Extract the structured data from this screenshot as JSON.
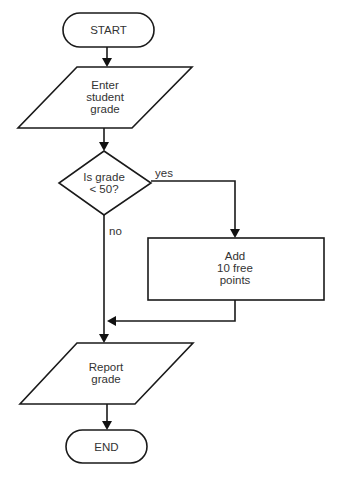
{
  "diagram": {
    "type": "flowchart",
    "nodes": {
      "start": {
        "shape": "terminator",
        "label": "START"
      },
      "input": {
        "shape": "parallelogram",
        "label": "Enter\nstudent\ngrade"
      },
      "decision": {
        "shape": "diamond",
        "label": "Is grade\n< 50?"
      },
      "process": {
        "shape": "rectangle",
        "label": "Add\n10 free\npoints"
      },
      "output": {
        "shape": "parallelogram",
        "label": "Report\ngrade"
      },
      "end": {
        "shape": "terminator",
        "label": "END"
      }
    },
    "edges": {
      "yes_label": "yes",
      "no_label": "no"
    },
    "connections": [
      [
        "start",
        "input"
      ],
      [
        "input",
        "decision"
      ],
      [
        "decision",
        "process",
        "yes"
      ],
      [
        "decision",
        "output",
        "no"
      ],
      [
        "process",
        "output"
      ],
      [
        "output",
        "end"
      ]
    ]
  }
}
